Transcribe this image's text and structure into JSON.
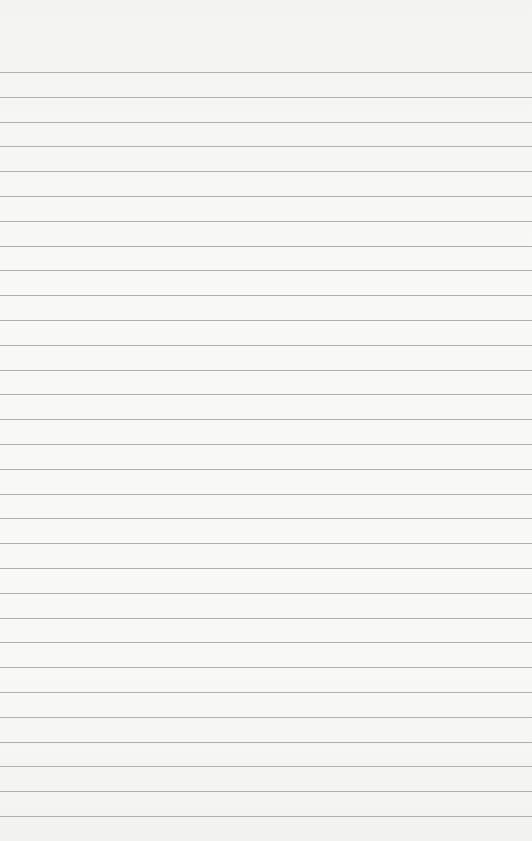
{
  "paper": {
    "type": "lined-paper",
    "background_color": "#f6f6f4",
    "line_color": "#a3a3a3",
    "first_line_y": 72,
    "line_spacing": 24.8,
    "line_count": 31
  }
}
